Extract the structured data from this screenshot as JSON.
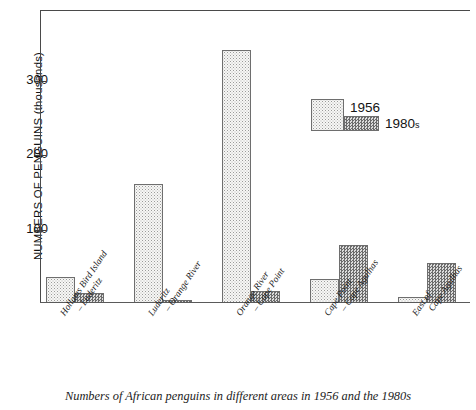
{
  "chart_data": {
    "type": "bar",
    "title": "",
    "caption": "Numbers of African penguins in different areas in 1956 and the 1980s",
    "xlabel": "",
    "ylabel": "NUMBERS OF PENGUINS (thousands)",
    "ylim": [
      0,
      395
    ],
    "yticks": [
      100,
      200,
      300
    ],
    "ytick_labels": [
      "100",
      "200",
      "300"
    ],
    "grid": false,
    "legend_position": "inside-upper-right",
    "categories": [
      "Hollams Bird Island – Luderitz",
      "Luderitz – Orange River",
      "Orange River – Cape Point",
      "Cape Point – Cape Agulhas",
      "East of Cape Agulhas"
    ],
    "category_lines": [
      [
        "Hollams Bird Island",
        "– Luderitz"
      ],
      [
        "Luderitz",
        "– Orange River"
      ],
      [
        "Orange River",
        "– Cape Point"
      ],
      [
        "Cape Point",
        "– Cape Agulhas"
      ],
      [
        "East of",
        "Cape Agulhas"
      ]
    ],
    "series": [
      {
        "name": "1956",
        "values": [
          35,
          160,
          340,
          32,
          8
        ]
      },
      {
        "name": "1980s",
        "values": [
          13,
          4,
          16,
          78,
          54
        ]
      }
    ]
  },
  "legend": {
    "items": [
      {
        "label": "1956",
        "suffix": ""
      },
      {
        "label": "1980",
        "suffix": "s"
      }
    ]
  },
  "axis": {
    "y_title": "NUMBERS OF PENGUINS (thousands)",
    "tick_300": "300",
    "tick_200": "200",
    "tick_100": "100"
  },
  "caption": {
    "text": "Numbers of African penguins in different areas in 1956 and the 1980s"
  }
}
